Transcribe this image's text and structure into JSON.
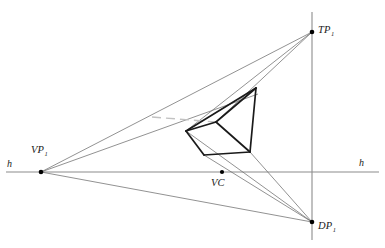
{
  "figure": {
    "type": "perspective-construction-diagram",
    "width": 385,
    "height": 248,
    "background_color": "#ffffff"
  },
  "labels": {
    "horizon_left": "h",
    "horizon_right": "h",
    "vanishing_point_1": "VP",
    "vanishing_point_1_sub": "1",
    "trace_point_1": "TP",
    "trace_point_1_sub": "1",
    "distance_point_1": "DP",
    "distance_point_1_sub": "1",
    "center_of_vision": "VC"
  },
  "colors": {
    "horizon_line": "#8c8c8c",
    "vertical_line": "#8c8c8c",
    "construction_ray": "#6e6e6e",
    "object_outline": "#1a1a1a",
    "hidden_edge": "#b9b9b9",
    "point_marker": "#000000",
    "text": "#1a1a1a"
  },
  "points": [
    {
      "name": "VP1",
      "x": 41,
      "y": 172,
      "label": "VP1",
      "on_horizon": true
    },
    {
      "name": "VC",
      "x": 222,
      "y": 172,
      "label": "VC",
      "on_horizon": true
    },
    {
      "name": "TP1",
      "x": 312,
      "y": 32,
      "label": "TP1",
      "on_horizon": false
    },
    {
      "name": "DP1",
      "x": 312,
      "y": 222,
      "label": "DP1",
      "on_horizon": false
    }
  ],
  "lines": {
    "horizon": {
      "x1": 6,
      "y1": 172,
      "x2": 379,
      "y2": 172,
      "width": 1.1
    },
    "vertical": {
      "x1": 312,
      "y1": 12,
      "x2": 312,
      "y2": 240,
      "width": 1.1
    }
  },
  "object_polygon": {
    "description": "bold perspective prism outline",
    "vertices": [
      {
        "id": "A",
        "x": 186,
        "y": 131
      },
      {
        "id": "B",
        "x": 256,
        "y": 88
      },
      {
        "id": "C",
        "x": 250,
        "y": 152
      },
      {
        "id": "D",
        "x": 204,
        "y": 155
      },
      {
        "id": "E",
        "x": 216,
        "y": 122
      }
    ],
    "edges": [
      [
        "A",
        "B"
      ],
      [
        "B",
        "C"
      ],
      [
        "C",
        "D"
      ],
      [
        "D",
        "A"
      ],
      [
        "A",
        "E"
      ],
      [
        "E",
        "B"
      ],
      [
        "E",
        "C"
      ]
    ],
    "stroke_width": 1.7
  },
  "construction_rays": [
    {
      "from": "VP1",
      "to_x": 256,
      "to_y": 88
    },
    {
      "from": "VP1",
      "to_x": 216,
      "to_y": 122
    },
    {
      "from": "VP1",
      "to_x": 250,
      "to_y": 152
    },
    {
      "from": "TP1",
      "to_x": 186,
      "to_y": 131
    },
    {
      "from": "TP1",
      "to_x": 216,
      "to_y": 122
    },
    {
      "from": "DP1",
      "to_x": 186,
      "to_y": 131
    },
    {
      "from": "DP1",
      "to_x": 250,
      "to_y": 152
    },
    {
      "from": "DP1",
      "to_x": 204,
      "to_y": 155
    }
  ],
  "hidden_line": {
    "description": "faint horizontal hidden edge",
    "x1": 154,
    "y1": 118,
    "x2": 216,
    "y2": 122
  }
}
